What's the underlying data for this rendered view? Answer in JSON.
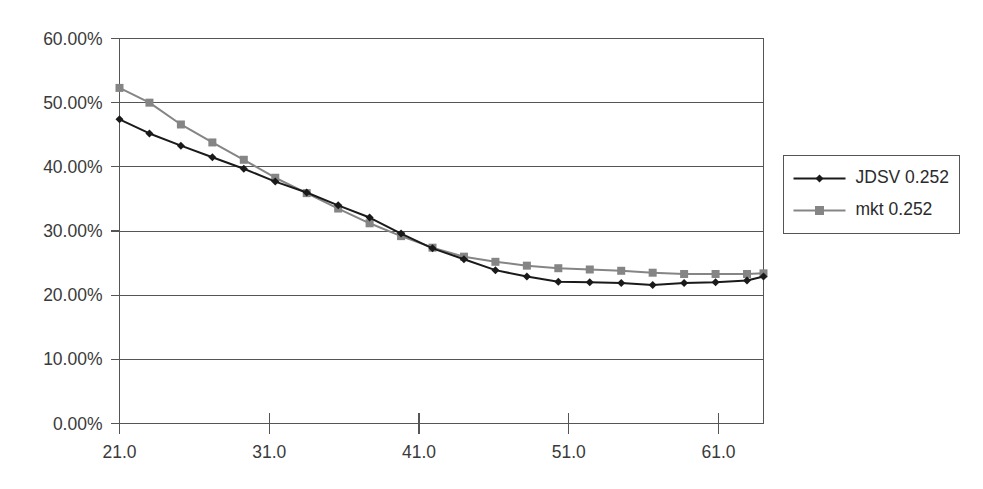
{
  "chart_data": {
    "type": "line",
    "title": "",
    "subtitle": "",
    "xlabel": "",
    "ylabel": "",
    "xlim": [
      21.0,
      64.0
    ],
    "ylim": [
      0.0,
      60.0
    ],
    "grid": true,
    "grid_axis": "y",
    "legend_position": "right",
    "y_tick_labels": [
      "60.00%",
      "50.00%",
      "40.00%",
      "30.00%",
      "20.00%",
      "10.00%",
      "0.00%"
    ],
    "y_ticks": [
      60.0,
      50.0,
      40.0,
      30.0,
      20.0,
      10.0,
      0.0
    ],
    "x_tick_labels": [
      "21.0",
      "31.0",
      "41.0",
      "51.0",
      "61.0"
    ],
    "x_ticks": [
      21.0,
      31.0,
      41.0,
      51.0,
      61.0
    ],
    "x": [
      21.0,
      23.0,
      25.1,
      27.2,
      29.3,
      31.4,
      33.5,
      35.6,
      37.7,
      39.8,
      41.9,
      44.0,
      46.1,
      48.2,
      50.3,
      52.4,
      54.5,
      56.6,
      58.7,
      60.8,
      62.9,
      64.0
    ],
    "series": [
      {
        "name": "JDSV 0.252",
        "color": "#1a1a1a",
        "marker": "diamond",
        "values": [
          47.4,
          45.2,
          43.3,
          41.5,
          39.7,
          37.7,
          36.0,
          34.0,
          32.1,
          29.6,
          27.3,
          25.6,
          23.9,
          22.9,
          22.1,
          22.0,
          21.9,
          21.6,
          21.9,
          22.0,
          22.3,
          22.9
        ]
      },
      {
        "name": "mkt 0.252",
        "color": "#858585",
        "marker": "square",
        "values": [
          52.3,
          50.0,
          46.6,
          43.8,
          41.1,
          38.3,
          35.9,
          33.5,
          31.2,
          29.2,
          27.4,
          26.0,
          25.2,
          24.6,
          24.2,
          24.0,
          23.8,
          23.5,
          23.3,
          23.3,
          23.3,
          23.4
        ]
      }
    ],
    "legend_entries": [
      {
        "label": "JDSV 0.252",
        "color": "#1a1a1a",
        "marker": "diamond"
      },
      {
        "label": "mkt 0.252",
        "color": "#858585",
        "marker": "square"
      }
    ]
  },
  "axis": {
    "y_labels": [
      "60.00%",
      "50.00%",
      "40.00%",
      "30.00%",
      "20.00%",
      "10.00%",
      "0.00%"
    ],
    "x_labels": [
      "21.0",
      "31.0",
      "41.0",
      "51.0",
      "61.0"
    ]
  },
  "legend": {
    "items": [
      {
        "label": "JDSV 0.252"
      },
      {
        "label": "mkt 0.252"
      }
    ]
  }
}
